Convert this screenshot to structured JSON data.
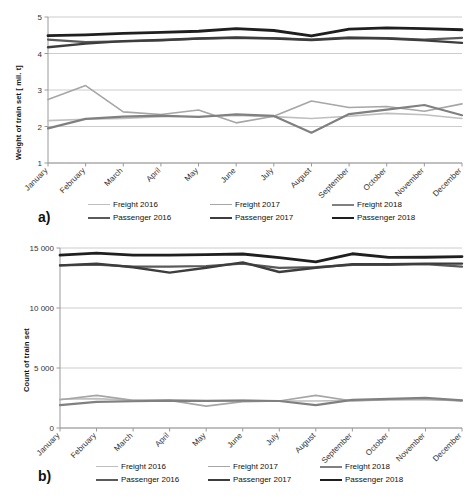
{
  "figure": {
    "title": "",
    "panels": [
      {
        "letter": "a)",
        "ylabel": "Weight of train set [ mil. t]",
        "yticks": [
          "1",
          "2",
          "3",
          "4",
          "5"
        ]
      },
      {
        "letter": "b)",
        "ylabel": "Count of train set",
        "yticks": [
          "0",
          "5 000",
          "10 000",
          "15 000"
        ]
      }
    ]
  },
  "months": [
    "January",
    "February",
    "March",
    "April",
    "May",
    "June",
    "July",
    "August",
    "September",
    "October",
    "November",
    "December"
  ],
  "legend": {
    "rows": [
      [
        {
          "label": "Freight 2016",
          "color": "#bfbfbf",
          "width": 1.6
        },
        {
          "label": "Freight 2017",
          "color": "#a6a6a6",
          "width": 1.6
        },
        {
          "label": "Freight 2018",
          "color": "#808080",
          "width": 2.2
        }
      ],
      [
        {
          "label": "Passenger 2016",
          "color": "#5a5a5a",
          "width": 2.2
        },
        {
          "label": "Passenger 2017",
          "color": "#3d3d3d",
          "width": 2.4
        },
        {
          "label": "Passenger 2018",
          "color": "#1f1f1f",
          "width": 2.8
        }
      ]
    ]
  },
  "chart_data": [
    {
      "type": "line",
      "title": "a)",
      "xlabel": "",
      "ylabel": "Weight of train set [ mil. t]",
      "ylim": [
        1,
        5
      ],
      "yticks": [
        1,
        2,
        3,
        4,
        5
      ],
      "grid": true,
      "legend_position": "bottom",
      "categories": [
        "January",
        "February",
        "March",
        "April",
        "May",
        "June",
        "July",
        "August",
        "September",
        "October",
        "November",
        "December"
      ],
      "series": [
        {
          "name": "Freight 2016",
          "color": "#bfbfbf",
          "width": 1.6,
          "values": [
            2.16,
            2.2,
            2.22,
            2.27,
            2.28,
            2.3,
            2.27,
            2.22,
            2.28,
            2.36,
            2.32,
            2.22
          ]
        },
        {
          "name": "Freight 2017",
          "color": "#a6a6a6",
          "width": 1.6,
          "values": [
            2.74,
            3.12,
            2.4,
            2.33,
            2.45,
            2.1,
            2.28,
            2.7,
            2.52,
            2.55,
            2.42,
            2.62
          ]
        },
        {
          "name": "Freight 2018",
          "color": "#808080",
          "width": 2.2,
          "values": [
            1.95,
            2.21,
            2.27,
            2.3,
            2.26,
            2.33,
            2.29,
            1.83,
            2.34,
            2.46,
            2.59,
            2.31
          ]
        },
        {
          "name": "Passenger 2016",
          "color": "#5a5a5a",
          "width": 2.2,
          "values": [
            4.38,
            4.31,
            4.33,
            4.36,
            4.41,
            4.43,
            4.42,
            4.38,
            4.44,
            4.42,
            4.38,
            4.43
          ]
        },
        {
          "name": "Passenger 2017",
          "color": "#3d3d3d",
          "width": 2.4,
          "values": [
            4.17,
            4.27,
            4.34,
            4.37,
            4.41,
            4.44,
            4.41,
            4.37,
            4.42,
            4.41,
            4.36,
            4.29
          ]
        },
        {
          "name": "Passenger 2018",
          "color": "#1f1f1f",
          "width": 2.8,
          "values": [
            4.49,
            4.51,
            4.55,
            4.58,
            4.61,
            4.68,
            4.63,
            4.48,
            4.67,
            4.7,
            4.68,
            4.65
          ]
        }
      ],
      "note_freight2017_dip_may": 1.78
    },
    {
      "type": "line",
      "title": "b)",
      "xlabel": "",
      "ylabel": "Count of train set",
      "ylim": [
        0,
        15000
      ],
      "yticks": [
        0,
        5000,
        10000,
        15000
      ],
      "grid": true,
      "legend_position": "bottom",
      "categories": [
        "January",
        "February",
        "March",
        "April",
        "May",
        "June",
        "July",
        "August",
        "September",
        "October",
        "November",
        "December"
      ],
      "series": [
        {
          "name": "Freight 2016",
          "color": "#bfbfbf",
          "width": 1.6,
          "values": [
            2400,
            2450,
            2300,
            2320,
            2300,
            2300,
            2250,
            2250,
            2300,
            2350,
            2350,
            2300
          ]
        },
        {
          "name": "Freight 2017",
          "color": "#a6a6a6",
          "width": 1.6,
          "values": [
            2350,
            2720,
            2300,
            2300,
            1820,
            2200,
            2250,
            2720,
            2250,
            2350,
            2400,
            2250
          ]
        },
        {
          "name": "Freight 2018",
          "color": "#808080",
          "width": 2.2,
          "values": [
            1900,
            2180,
            2230,
            2280,
            2250,
            2280,
            2250,
            1900,
            2350,
            2420,
            2520,
            2300
          ]
        },
        {
          "name": "Passenger 2016",
          "color": "#5a5a5a",
          "width": 2.2,
          "values": [
            13550,
            13620,
            13450,
            13450,
            13500,
            13700,
            13350,
            13400,
            13600,
            13600,
            13650,
            13450
          ]
        },
        {
          "name": "Passenger 2017",
          "color": "#3d3d3d",
          "width": 2.4,
          "values": [
            13550,
            13700,
            13400,
            12950,
            13350,
            13800,
            13000,
            13350,
            13650,
            13650,
            13700,
            13700
          ]
        },
        {
          "name": "Passenger 2018",
          "color": "#1f1f1f",
          "width": 2.8,
          "values": [
            14400,
            14570,
            14400,
            14400,
            14450,
            14500,
            14200,
            13850,
            14520,
            14220,
            14230,
            14280
          ]
        }
      ]
    }
  ]
}
